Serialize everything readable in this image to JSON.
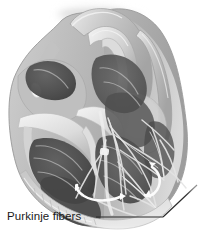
{
  "figure": {
    "style": "grayscale anatomical illustration",
    "width": 200,
    "height": 238,
    "background_color": "#ffffff"
  },
  "labels": [
    {
      "id": "purkinje-fibers",
      "text": "Purkinje fibers",
      "x": 7,
      "y": 210,
      "color": "#1a1a1a",
      "leader": {
        "type": "elbow",
        "segments": [
          {
            "x1": 96,
            "y1": 217,
            "x2": 163,
            "y2": 217
          },
          {
            "x1": 163,
            "y1": 217,
            "x2": 196,
            "y2": 186
          }
        ],
        "color": "#2b2b2b"
      }
    }
  ],
  "colors": {
    "background": "#ffffff",
    "outline": "#8f8f8f",
    "myocardium_light": "#d8d8d8",
    "myocardium_mid": "#b3b3b3",
    "myocardium_dark": "#8a8a8a",
    "chamber_dark": "#4a4a4a",
    "chamber_darkest": "#3a3a3a",
    "trabeculae": "#c9c9c9",
    "valve_light": "#ececec",
    "fiber_light": "#e2e2e2",
    "arrow_white": "#fbfbfb",
    "node_white": "#f5f5f5",
    "label_text": "#1a1a1a",
    "leader_line": "#2b2b2b"
  },
  "structures": {
    "great_vessels": "aortic arch and pulmonary trunk arches at top",
    "atria": "upper chambers shown in mid-gray shading",
    "ventricles": "dark cut-open chambers occupying lower two-thirds",
    "septum": "light vertical band dividing ventricles",
    "conduction_network": "pale branching Purkinje fiber strands lining ventricular walls",
    "node_marker": "small white oval node on left wall",
    "flow_arrows": "two white curved directional arrows in ventricular apex region"
  }
}
